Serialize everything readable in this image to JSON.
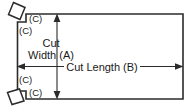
{
  "diagram": {
    "type": "engineering-cut-dimension-diagram",
    "colors": {
      "line": "#2b2b2b",
      "text": "#1a1a1a",
      "background": "#ffffff",
      "fill": "#ffffff"
    },
    "dimensions": {
      "width_label_line1": "Cut",
      "width_label_line2": "Width (A)",
      "length_label": "Cut Length (B)"
    },
    "corner_labels": {
      "top_outer": "(C)",
      "top_inner": "(C)",
      "bottom_inner": "(C)",
      "bottom_outer": "(C)"
    },
    "shapes": {
      "sheet_name": "cut-sheet-outline",
      "corner_piece_top_name": "corner-cutoff-piece-top",
      "corner_piece_bottom_name": "corner-cutoff-piece-bottom"
    }
  }
}
